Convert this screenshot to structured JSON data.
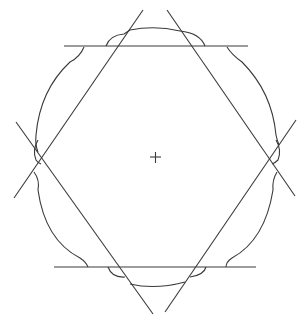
{
  "diagram": {
    "colors": {
      "stroke": "#3a3a3a",
      "background": "#ffffff"
    },
    "center": {
      "x": 155,
      "y": 157
    },
    "lines": [
      {
        "id": "top-horizontal",
        "x1": 64,
        "y1": 46,
        "x2": 248,
        "y2": 46
      },
      {
        "id": "bottom-horizontal",
        "x1": 54,
        "y1": 267,
        "x2": 256,
        "y2": 267
      },
      {
        "id": "left-rising",
        "x1": 143,
        "y1": 10,
        "x2": 14,
        "y2": 198
      },
      {
        "id": "right-falling",
        "x1": 167,
        "y1": 10,
        "x2": 295,
        "y2": 196
      },
      {
        "id": "left-falling",
        "x1": 16,
        "y1": 122,
        "x2": 153,
        "y2": 314
      },
      {
        "id": "right-rising",
        "x1": 296,
        "y1": 120,
        "x2": 165,
        "y2": 312
      }
    ]
  }
}
